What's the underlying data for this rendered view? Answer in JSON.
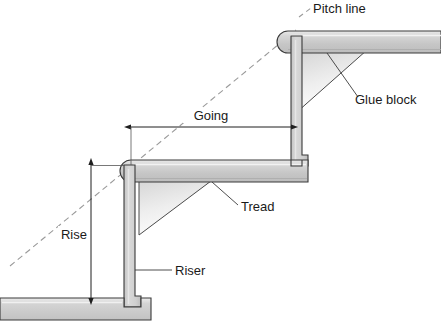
{
  "diagram": {
    "labels": {
      "pitch_line": "Pitch line",
      "glue_block": "Glue block",
      "going": "Going",
      "tread": "Tread",
      "rise": "Rise",
      "riser": "Riser"
    },
    "colors": {
      "timber_fill": "#c9c9c9",
      "timber_light": "#e4e4e4",
      "timber_edge": "#3a3a3a",
      "glue_block_top": "#d2d2d2",
      "glue_block_bottom": "#fdfdfd",
      "pitch_line": "#9a9a9a",
      "dimension_line": "#333333",
      "background": "#ffffff",
      "text": "#1a1a1a"
    },
    "parts": [
      {
        "name": "upper-tread",
        "label": "Tread"
      },
      {
        "name": "upper-riser",
        "label": "Riser"
      },
      {
        "name": "upper-glue-block",
        "label": "Glue block"
      },
      {
        "name": "middle-tread",
        "label": "Tread"
      },
      {
        "name": "lower-riser",
        "label": "Riser"
      },
      {
        "name": "lower-glue-block",
        "label": "Glue block"
      },
      {
        "name": "floor-slab",
        "label": "Floor"
      }
    ],
    "dimensions": [
      {
        "name": "rise",
        "label": "Rise",
        "orientation": "vertical"
      },
      {
        "name": "going",
        "label": "Going",
        "orientation": "horizontal"
      }
    ],
    "guides": [
      {
        "name": "pitch-line",
        "label": "Pitch line",
        "style": "dashed"
      }
    ]
  }
}
